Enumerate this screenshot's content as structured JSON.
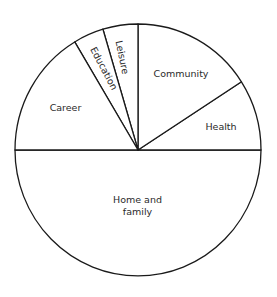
{
  "chart_data": {
    "type": "pie",
    "title": "",
    "unit": "percent (estimated from slice angles)",
    "categories": [
      "Home and family",
      "Health",
      "Community",
      "Leisure",
      "Education",
      "Career"
    ],
    "values": [
      50,
      9.1,
      15.9,
      4.6,
      4.0,
      16.4
    ],
    "start_angle_deg": 0,
    "direction": "counterclockwise",
    "legend": "none (labels inside slices)",
    "colors": {
      "fill": "#ffffff",
      "stroke": "#1a1a1a",
      "text": "#2a2a2a"
    }
  },
  "labels": {
    "home_line1": "Home and",
    "home_line2": "family",
    "health": "Health",
    "community": "Community",
    "leisure": "Leisure",
    "education": "Education",
    "career": "Career"
  }
}
